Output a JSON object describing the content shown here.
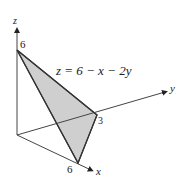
{
  "diagram": {
    "equation": "z = 6 − x − 2y",
    "axes": {
      "x": {
        "label": "x"
      },
      "y": {
        "label": "y"
      },
      "z": {
        "label": "z"
      }
    },
    "intercepts": {
      "z": "6",
      "y": "3",
      "x": "6"
    },
    "colors": {
      "plane_fill": "#cfcfcf",
      "line": "#333333"
    }
  }
}
